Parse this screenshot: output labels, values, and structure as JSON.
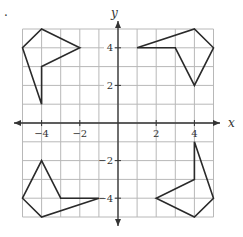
{
  "figure": {
    "marker": ".",
    "axes": {
      "x_label": "x",
      "y_label": "y",
      "x_range": [
        -5,
        5
      ],
      "y_range": [
        -5,
        5
      ],
      "grid": true,
      "x_ticks": [
        {
          "value": -4,
          "label": "−4"
        },
        {
          "value": -2,
          "label": "−2"
        },
        {
          "value": 2,
          "label": "2"
        },
        {
          "value": 4,
          "label": "4"
        }
      ],
      "y_ticks": [
        {
          "value": 4,
          "label": "4"
        },
        {
          "value": 2,
          "label": "2"
        },
        {
          "value": -2,
          "label": "−2"
        },
        {
          "value": -4,
          "label": "−4"
        }
      ]
    },
    "colors": {
      "grid": "#b8b8b8",
      "axis": "#333333",
      "shape": "#2a2a2a"
    },
    "shapes": [
      {
        "name": "top-left-pentagon",
        "points": [
          [
            -4,
            5
          ],
          [
            -2,
            4
          ],
          [
            -4,
            3
          ],
          [
            -4,
            1
          ],
          [
            -5,
            4
          ]
        ]
      },
      {
        "name": "top-right-pentagon",
        "points": [
          [
            1,
            4
          ],
          [
            4,
            5
          ],
          [
            5,
            4
          ],
          [
            4,
            2
          ],
          [
            3,
            4
          ]
        ]
      },
      {
        "name": "bottom-left-pentagon",
        "points": [
          [
            -4,
            -2
          ],
          [
            -3,
            -4
          ],
          [
            -1,
            -4
          ],
          [
            -4,
            -5
          ],
          [
            -5,
            -4
          ]
        ]
      },
      {
        "name": "bottom-right-pentagon",
        "points": [
          [
            4,
            -1
          ],
          [
            5,
            -4
          ],
          [
            4,
            -5
          ],
          [
            2,
            -4
          ],
          [
            4,
            -3
          ]
        ]
      }
    ]
  }
}
